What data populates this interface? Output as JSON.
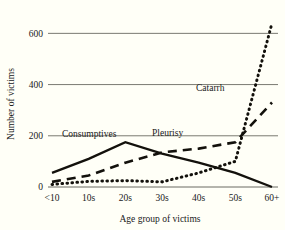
{
  "chart_data": {
    "type": "line",
    "title": "",
    "xlabel": "Age group of victims",
    "ylabel": "Number of victims",
    "categories": [
      "<10",
      "10s",
      "20s",
      "30s",
      "40s",
      "50s",
      "60+"
    ],
    "ylim": [
      0,
      660
    ],
    "yticks": [
      0,
      200,
      400,
      600
    ],
    "ytick_labels": [
      "0",
      "200",
      "400",
      "600"
    ],
    "grid": "horizontal",
    "legend_position": "inline-annotations",
    "series": [
      {
        "name": "Consumptives",
        "style": "solid",
        "values": [
          55,
          110,
          175,
          130,
          95,
          55,
          0
        ],
        "label_x_category": "<10",
        "label_text": "Consumptives"
      },
      {
        "name": "Pleurisy",
        "style": "dashed",
        "values": [
          20,
          45,
          95,
          135,
          150,
          175,
          330
        ],
        "label_x_category": "30s",
        "label_text": "Pleurisy"
      },
      {
        "name": "Catarrh",
        "style": "dotted",
        "values": [
          10,
          22,
          25,
          20,
          55,
          100,
          640
        ],
        "label_x_category": "50s",
        "label_text": "Catarrh"
      }
    ],
    "annotations": [
      {
        "text": "Consumptives",
        "x": 62,
        "y": 137
      },
      {
        "text": "Pleurisy",
        "x": 152,
        "y": 136
      },
      {
        "text": "Catarrh",
        "x": 196,
        "y": 91
      }
    ]
  }
}
